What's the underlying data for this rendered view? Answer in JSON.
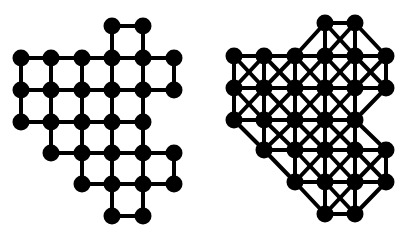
{
  "figure": {
    "colors": {
      "node": "#000000",
      "edge": "#000000",
      "background": "#ffffff"
    },
    "node_radius": 8.5,
    "edge_width": 4
  },
  "node_cells": [
    [
      0,
      3
    ],
    [
      0,
      4
    ],
    [
      1,
      0
    ],
    [
      1,
      1
    ],
    [
      1,
      2
    ],
    [
      1,
      3
    ],
    [
      1,
      4
    ],
    [
      1,
      5
    ],
    [
      2,
      0
    ],
    [
      2,
      1
    ],
    [
      2,
      2
    ],
    [
      2,
      3
    ],
    [
      2,
      4
    ],
    [
      2,
      5
    ],
    [
      3,
      0
    ],
    [
      3,
      1
    ],
    [
      3,
      2
    ],
    [
      3,
      3
    ],
    [
      3,
      4
    ],
    [
      4,
      1
    ],
    [
      4,
      2
    ],
    [
      4,
      3
    ],
    [
      4,
      4
    ],
    [
      4,
      5
    ],
    [
      5,
      2
    ],
    [
      5,
      3
    ],
    [
      5,
      4
    ],
    [
      5,
      5
    ],
    [
      6,
      3
    ],
    [
      6,
      4
    ]
  ],
  "graphs": [
    {
      "id": "grid-graph",
      "adjacency": "4-neighbour",
      "col_x": [
        21,
        51,
        82,
        112,
        143,
        174
      ],
      "row_y": [
        26,
        58,
        90,
        122,
        153,
        184,
        216
      ]
    },
    {
      "id": "king-graph",
      "adjacency": "8-neighbour",
      "col_x": [
        234,
        264,
        295,
        325,
        355,
        386
      ],
      "row_y": [
        23,
        56,
        88,
        120,
        150,
        182,
        214
      ]
    }
  ]
}
